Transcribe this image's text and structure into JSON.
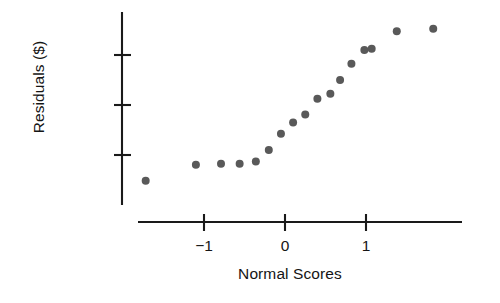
{
  "chart_data": {
    "type": "scatter",
    "title": "",
    "xlabel": "Normal Scores",
    "ylabel": "Residuals ($)",
    "xlim": [
      -1.85,
      2.05
    ],
    "ylim": [
      -6400,
      7200
    ],
    "xticks": [
      -1,
      0,
      1
    ],
    "xtick_labels": [
      "−1",
      "0",
      "1"
    ],
    "yticks": [
      -4000,
      0,
      4000
    ],
    "ytick_labels": [
      "−4000",
      "0",
      "4000"
    ],
    "grid": false,
    "legend": null,
    "marker": {
      "shape": "circle",
      "color": "#595959",
      "size_px": 8
    },
    "x": [
      -1.72,
      -1.1,
      -0.79,
      -0.56,
      -0.36,
      -0.2,
      -0.05,
      0.1,
      0.25,
      0.4,
      0.56,
      0.68,
      0.82,
      0.98,
      1.07,
      1.38,
      1.83
    ],
    "y": [
      -6050,
      -4780,
      -4700,
      -4700,
      -4520,
      -3600,
      -2300,
      -1400,
      -750,
      500,
      900,
      2000,
      3300,
      4400,
      4500,
      5900,
      6100
    ],
    "points": [
      {
        "x": -1.72,
        "y": -6050
      },
      {
        "x": -1.1,
        "y": -4780
      },
      {
        "x": -0.79,
        "y": -4700
      },
      {
        "x": -0.56,
        "y": -4700
      },
      {
        "x": -0.36,
        "y": -4520
      },
      {
        "x": -0.2,
        "y": -3600
      },
      {
        "x": -0.05,
        "y": -2300
      },
      {
        "x": 0.1,
        "y": -1400
      },
      {
        "x": 0.25,
        "y": -750
      },
      {
        "x": 0.4,
        "y": 500
      },
      {
        "x": 0.56,
        "y": 900
      },
      {
        "x": 0.68,
        "y": 2000
      },
      {
        "x": 0.82,
        "y": 3300
      },
      {
        "x": 0.98,
        "y": 4400
      },
      {
        "x": 1.07,
        "y": 4500
      },
      {
        "x": 1.38,
        "y": 5900
      },
      {
        "x": 1.83,
        "y": 6100
      }
    ]
  },
  "axes": {
    "axis_color": "#1a1a1a",
    "background": "#ffffff"
  }
}
